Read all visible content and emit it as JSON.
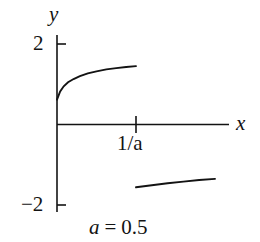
{
  "figure": {
    "caption": "a = 0.5",
    "caption_parts": {
      "symbol": "a",
      "relation": "=",
      "value": "0.5"
    },
    "background_color": "#ffffff",
    "ink_color": "#131313"
  },
  "axes": {
    "x_axis_label": "x",
    "y_axis_label": "y",
    "x_ticks": [
      {
        "label": "1/a",
        "value": 2
      }
    ],
    "y_ticks": [
      {
        "label": "2",
        "value": 2
      },
      {
        "label": "−2",
        "value": -2
      }
    ],
    "x_range": [
      -0.2,
      4.0
    ],
    "y_range": [
      -2.45,
      2.45
    ],
    "grid": false,
    "origin_label": ""
  },
  "chart_data": {
    "type": "line",
    "title": "",
    "subtitle": "a = 0.5",
    "xlabel": "x",
    "ylabel": "y",
    "xlim": [
      -0.2,
      4.0
    ],
    "ylim": [
      -2.45,
      2.45
    ],
    "grid": false,
    "legend": "none",
    "annotations": [
      {
        "text": "1/a",
        "x": 2.0,
        "y": -0.45,
        "role": "x-tick-label"
      },
      {
        "text": "2",
        "x": -0.35,
        "y": 2.0,
        "role": "y-tick-label"
      },
      {
        "text": "−2",
        "x": -0.55,
        "y": -2.0,
        "role": "y-tick-label"
      },
      {
        "text": "a = 0.5",
        "x": 1.8,
        "y": -2.85,
        "role": "caption"
      }
    ],
    "series": [
      {
        "name": "upper-branch",
        "comment": "rising concave branch from x=0 to x=2 (=1/a), y from ~0.62 to ~1.45",
        "x": [
          0.0,
          0.08,
          0.17,
          0.28,
          0.42,
          0.58,
          0.78,
          1.0,
          1.25,
          1.5,
          1.75,
          2.0
        ],
        "y": [
          0.62,
          0.82,
          0.95,
          1.05,
          1.13,
          1.2,
          1.27,
          1.32,
          1.37,
          1.4,
          1.43,
          1.45
        ]
      },
      {
        "name": "lower-branch",
        "comment": "nearly flat branch from x=2 (=1/a) rightward, y from ~-1.56 to ~-1.35",
        "x": [
          2.0,
          2.4,
          2.8,
          3.2,
          3.6,
          4.0
        ],
        "y": [
          -1.56,
          -1.51,
          -1.46,
          -1.42,
          -1.38,
          -1.35
        ]
      }
    ]
  }
}
